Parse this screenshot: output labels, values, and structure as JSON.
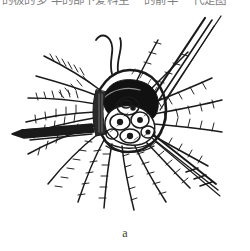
{
  "page": {
    "background_color": "#ffffff",
    "ink_color": "#1a1a1a",
    "width": 250,
    "height": 251
  },
  "header_text": {
    "cropped_line": "的极的多 半的部下爱科生  一的前半 一代是图",
    "note": "partially cropped line of CJK text at top edge"
  },
  "figure": {
    "caption": "a",
    "type": "ink line drawing",
    "elements": {
      "central_cluster": "lobed cell-like bodies",
      "dark_cavity": "solid black filled region above cluster",
      "radiating_setae_count": 18,
      "long_diagonal_spines": 4,
      "left_appendage": "pointed horizontal blade"
    }
  }
}
